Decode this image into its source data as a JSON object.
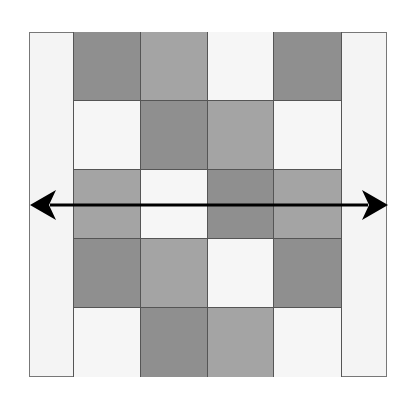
{
  "diagram": {
    "colors": {
      "dark": "#8f8f8f",
      "mid": "#a4a4a4",
      "light": "#f6f6f6",
      "margin": "#f4f4f4",
      "arrow": "#000000"
    },
    "rows": [
      [
        "dark",
        "mid",
        "light",
        "dark"
      ],
      [
        "light",
        "dark",
        "mid",
        "light"
      ],
      [
        "mid",
        "light",
        "dark",
        "mid"
      ],
      [
        "dark",
        "mid",
        "light",
        "dark"
      ],
      [
        "light",
        "dark",
        "mid",
        "light"
      ]
    ],
    "arrow": {
      "type": "double-headed",
      "orientation": "horizontal",
      "y": 205,
      "x_start": 30,
      "x_end": 388
    }
  }
}
